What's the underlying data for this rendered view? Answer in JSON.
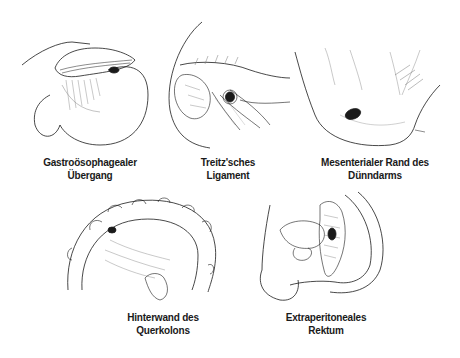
{
  "figure": {
    "panels": [
      {
        "id": "gastroesophageal",
        "caption_lines": [
          "Gastroösophagealer",
          "Übergang"
        ]
      },
      {
        "id": "treitz",
        "caption_lines": [
          "Treitz'sches",
          "Ligament"
        ]
      },
      {
        "id": "mesenteric",
        "caption_lines": [
          "Mesenterialer Rand des",
          "Dünndarms"
        ]
      },
      {
        "id": "transverse-colon",
        "caption_lines": [
          "Hinterwand des",
          "Querkolons"
        ]
      },
      {
        "id": "rectum",
        "caption_lines": [
          "Extraperitoneales",
          "Rektum"
        ]
      }
    ],
    "colors": {
      "ink": "#1a1a1a",
      "background": "#ffffff",
      "shading": "#555555"
    }
  }
}
